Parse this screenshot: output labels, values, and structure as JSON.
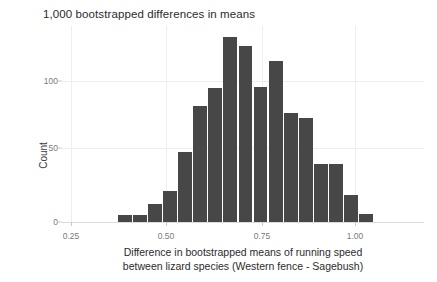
{
  "figure": {
    "title": "1,000 bootstrapped differences in means",
    "background_color": "#ffffff",
    "bar_color": "#474747",
    "grid_color": "#eceff1",
    "axis_text_color": "#7a7a7a"
  },
  "axes": {
    "y_label": "Count",
    "y_ticks": [
      "0",
      "50",
      "100"
    ],
    "x_ticks": [
      "0.25",
      "0.50",
      "0.75",
      "1.00"
    ],
    "x_label_line1": "Difference in bootstrapped means of running speed",
    "x_label_line2": "between lizard species (Western fence - Sagebush)"
  },
  "chart_data": {
    "type": "bar",
    "title": "1,000 bootstrapped differences in means",
    "xlabel": "Difference in bootstrapped means of running speed between lizard species (Western fence - Sagebush)",
    "ylabel": "Count",
    "xlim": [
      0.18,
      1.08
    ],
    "ylim": [
      0,
      140
    ],
    "grid": true,
    "legend": null,
    "bin_width": 0.0375,
    "categories": [
      "0.3375",
      "0.3750",
      "0.4125",
      "0.4500",
      "0.4875",
      "0.5250",
      "0.5625",
      "0.6000",
      "0.6375",
      "0.6750",
      "0.7125",
      "0.7500",
      "0.7875",
      "0.8250",
      "0.8625",
      "0.9000",
      "0.9375",
      "0.9750"
    ],
    "bin_starts": [
      0.3188,
      0.3563,
      0.3938,
      0.4313,
      0.4688,
      0.5063,
      0.5438,
      0.5813,
      0.6188,
      0.6563,
      0.6938,
      0.7313,
      0.7688,
      0.8063,
      0.8438,
      0.8813,
      0.9188,
      0.9563
    ],
    "values": [
      5,
      5,
      13,
      22,
      50,
      82,
      95,
      131,
      125,
      96,
      114,
      77,
      74,
      41,
      41,
      19,
      6,
      0
    ],
    "y_ticks": [
      0,
      50,
      100
    ],
    "x_ticks": [
      0.25,
      0.5,
      0.75,
      1.0
    ],
    "n_observations": 1000
  }
}
